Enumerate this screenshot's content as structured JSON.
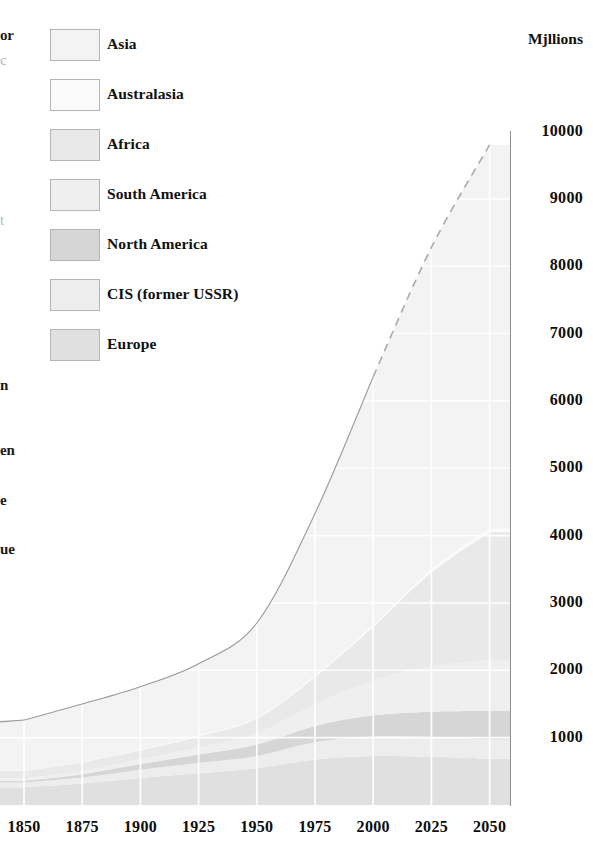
{
  "chart_data": {
    "type": "area",
    "stacked": true,
    "title": "",
    "xlabel": "",
    "ylabel": "Mjllions",
    "x": [
      1850,
      1875,
      1900,
      1925,
      1950,
      1975,
      2000,
      2025,
      2050
    ],
    "xlim": [
      1850,
      2050
    ],
    "ylim": [
      0,
      10000
    ],
    "x_tick_labels": [
      "1850",
      "1875",
      "1900",
      "1925",
      "1950",
      "1975",
      "2000",
      "2025",
      "2050"
    ],
    "y_tick_labels": [
      "1000",
      "2000",
      "3000",
      "4000",
      "5000",
      "6000",
      "7000",
      "8000",
      "9000",
      "10000"
    ],
    "y_tick_values": [
      1000,
      2000,
      3000,
      4000,
      5000,
      6000,
      7000,
      8000,
      9000,
      10000
    ],
    "grid": true,
    "grid_color": "#ffffff",
    "legend_position": "top-left",
    "projection_note": "dashed line from 2000 to 2050 indicates projected total",
    "projection_start_year": 2000,
    "series": [
      {
        "name": "Europe",
        "color": "#e0e0e0",
        "values": [
          265,
          320,
          400,
          470,
          547,
          676,
          727,
          715,
          685
        ]
      },
      {
        "name": "CIS (former USSR)",
        "color": "#ededed",
        "values": [
          70,
          90,
          125,
          155,
          180,
          255,
          290,
          295,
          290
        ]
      },
      {
        "name": "North America",
        "color": "#d6d6d6",
        "values": [
          26,
          48,
          82,
          125,
          172,
          243,
          314,
          375,
          420
        ]
      },
      {
        "name": "South America",
        "color": "#efefef",
        "values": [
          33,
          45,
          74,
          104,
          167,
          322,
          519,
          670,
          760
        ]
      },
      {
        "name": "Africa",
        "color": "#e9e9e9",
        "values": [
          111,
          132,
          133,
          164,
          221,
          406,
          795,
          1400,
          1900
        ]
      },
      {
        "name": "Australasia",
        "color": "#fbfbfb",
        "values": [
          2,
          3,
          6,
          10,
          13,
          21,
          31,
          40,
          46
        ]
      },
      {
        "name": "Asia",
        "color": "#f3f3f3",
        "values": [
          754,
          862,
          937,
          1070,
          1402,
          2406,
          3683,
          4785,
          5700
        ]
      }
    ],
    "totals": [
      1261,
      1500,
      1757,
      2098,
      2702,
      4329,
      6359,
      8280,
      9801
    ]
  },
  "legend": {
    "items": [
      {
        "label": "Asia",
        "color": "#f3f3f3"
      },
      {
        "label": "Australasia",
        "color": "#fbfbfb"
      },
      {
        "label": "Africa",
        "color": "#e9e9e9"
      },
      {
        "label": "South America",
        "color": "#efefef"
      },
      {
        "label": "North America",
        "color": "#d6d6d6"
      },
      {
        "label": "CIS (former USSR)",
        "color": "#ededed"
      },
      {
        "label": "Europe",
        "color": "#e0e0e0"
      }
    ]
  },
  "axes": {
    "y_axis_title": "Mjllions",
    "y_ticks": [
      "10000",
      "9000",
      "8000",
      "7000",
      "6000",
      "5000",
      "4000",
      "3000",
      "2000",
      "1000"
    ],
    "x_ticks": [
      "1850",
      "1875",
      "1900",
      "1925",
      "1950",
      "1975",
      "2000",
      "2025",
      "2050"
    ]
  },
  "left_gutter_fragments": [
    {
      "text": "or",
      "top": 27,
      "faint": false
    },
    {
      "text": "c",
      "top": 52,
      "faint": true
    },
    {
      "text": "t",
      "top": 212,
      "faint": true
    },
    {
      "text": "n",
      "top": 377,
      "faint": false
    },
    {
      "text": "en",
      "top": 442,
      "faint": false
    },
    {
      "text": "e",
      "top": 492,
      "faint": false
    },
    {
      "text": "ue",
      "top": 541,
      "faint": false
    }
  ]
}
